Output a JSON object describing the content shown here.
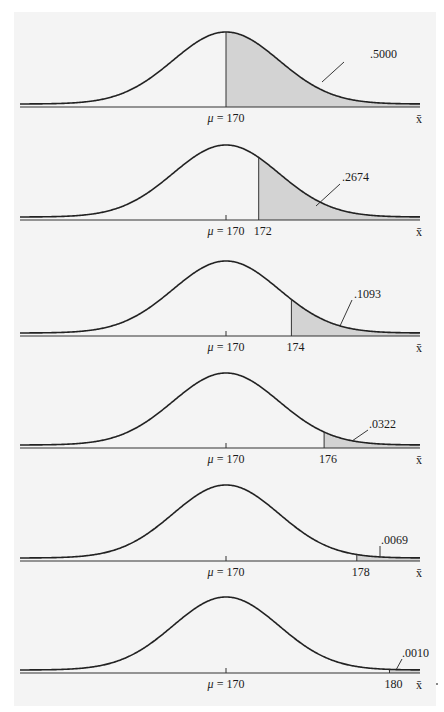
{
  "figure": {
    "mean_label": "μ = 170",
    "x_axis_symbol": "x̄",
    "colors": {
      "curve": "#222222",
      "shade": "#d3d3d3",
      "axis": "#333333",
      "background": "#f4f4f4"
    }
  },
  "chart_data": [
    {
      "type": "area",
      "title": "",
      "mean": 170,
      "cutoff": 170,
      "tail": "upper",
      "area_label": ".5000",
      "tick_labels": [
        "μ = 170"
      ],
      "xlabel": "x̄"
    },
    {
      "type": "area",
      "title": "",
      "mean": 170,
      "cutoff": 172,
      "tail": "upper",
      "area_label": ".2674",
      "tick_labels": [
        "μ = 170",
        "172"
      ],
      "xlabel": "x̄"
    },
    {
      "type": "area",
      "title": "",
      "mean": 170,
      "cutoff": 174,
      "tail": "upper",
      "area_label": ".1093",
      "tick_labels": [
        "μ = 170",
        "174"
      ],
      "xlabel": "x̄"
    },
    {
      "type": "area",
      "title": "",
      "mean": 170,
      "cutoff": 176,
      "tail": "upper",
      "area_label": ".0322",
      "tick_labels": [
        "μ = 170",
        "176"
      ],
      "xlabel": "x̄"
    },
    {
      "type": "area",
      "title": "",
      "mean": 170,
      "cutoff": 178,
      "tail": "upper",
      "area_label": ".0069",
      "tick_labels": [
        "μ = 170",
        "178"
      ],
      "xlabel": "x̄"
    },
    {
      "type": "area",
      "title": "",
      "mean": 170,
      "cutoff": 180,
      "tail": "upper",
      "area_label": ".0010",
      "tick_labels": [
        "μ = 170",
        "180"
      ],
      "xlabel": "x̄"
    }
  ],
  "panels": [
    {
      "cutoff_label": "",
      "area_label": ".5000"
    },
    {
      "cutoff_label": "172",
      "area_label": ".2674"
    },
    {
      "cutoff_label": "174",
      "area_label": ".1093"
    },
    {
      "cutoff_label": "176",
      "area_label": ".0322"
    },
    {
      "cutoff_label": "178",
      "area_label": ".0069"
    },
    {
      "cutoff_label": "180",
      "area_label": ".0010"
    }
  ]
}
